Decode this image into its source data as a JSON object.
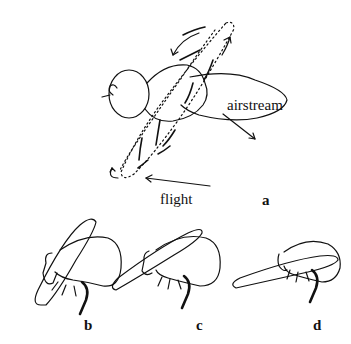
{
  "figure": {
    "panel_a": {
      "label": "a",
      "annotations": {
        "airstream": "airstream",
        "flight": "flight"
      }
    },
    "panels": [
      {
        "id": "b",
        "label": "b"
      },
      {
        "id": "c",
        "label": "c"
      },
      {
        "id": "d",
        "label": "d"
      }
    ],
    "colors": {
      "stroke": "#111111",
      "background": "#ffffff"
    }
  }
}
